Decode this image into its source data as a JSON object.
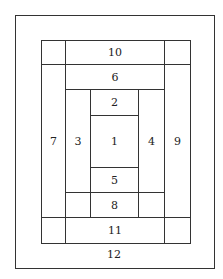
{
  "diagram": {
    "type": "log-cabin-quilt-block-layout",
    "stroke_color": "#333333",
    "background": "#ffffff",
    "outer_border": {
      "x": 15,
      "y": 15,
      "w": 199,
      "h": 253
    },
    "inner_block": {
      "x": 41,
      "y": 40,
      "w": 149,
      "h": 203
    },
    "pieces": [
      {
        "label": "1",
        "x": 90,
        "y": 115,
        "w": 48,
        "h": 52
      },
      {
        "label": "2",
        "x": 90,
        "y": 89,
        "w": 48,
        "h": 26
      },
      {
        "label": "3",
        "x": 65,
        "y": 89,
        "w": 25,
        "h": 103
      },
      {
        "label": "4",
        "x": 138,
        "y": 89,
        "w": 26,
        "h": 103
      },
      {
        "label": "5",
        "x": 90,
        "y": 167,
        "w": 48,
        "h": 25
      },
      {
        "label": "6",
        "x": 65,
        "y": 64,
        "w": 99,
        "h": 25
      },
      {
        "label": "7",
        "x": 41,
        "y": 64,
        "w": 24,
        "h": 153
      },
      {
        "label": "8",
        "x": 90,
        "y": 192,
        "w": 48,
        "h": 25
      },
      {
        "label": "9",
        "x": 164,
        "y": 64,
        "w": 26,
        "h": 153
      },
      {
        "label": "10",
        "x": 65,
        "y": 40,
        "w": 99,
        "h": 24
      },
      {
        "label": "11",
        "x": 65,
        "y": 217,
        "w": 99,
        "h": 26
      }
    ],
    "blank_cells": [
      {
        "x": 41,
        "y": 40,
        "w": 24,
        "h": 24
      },
      {
        "x": 164,
        "y": 40,
        "w": 26,
        "h": 24
      },
      {
        "x": 41,
        "y": 217,
        "w": 24,
        "h": 26
      },
      {
        "x": 164,
        "y": 217,
        "w": 26,
        "h": 26
      },
      {
        "x": 65,
        "y": 192,
        "w": 25,
        "h": 25
      },
      {
        "x": 138,
        "y": 192,
        "w": 26,
        "h": 25
      }
    ],
    "border_label": {
      "label": "12",
      "x": 114,
      "y": 255
    }
  }
}
